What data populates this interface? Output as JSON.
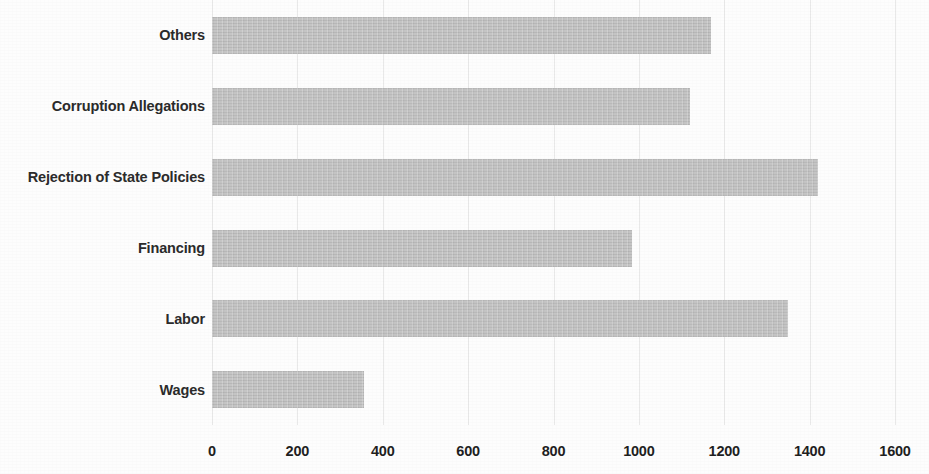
{
  "chart_data": {
    "type": "bar",
    "orientation": "horizontal",
    "title": "",
    "subtitle": "",
    "xlabel": "",
    "ylabel": "",
    "categories": [
      "Wages",
      "Labor",
      "Financing",
      "Rejection of State Policies",
      "Corruption Allegations",
      "Others"
    ],
    "values": [
      355,
      1350,
      985,
      1420,
      1120,
      1170
    ],
    "series": [
      {
        "name": "Count",
        "values": [
          355,
          1350,
          985,
          1420,
          1120,
          1170
        ]
      }
    ],
    "xlim": [
      0,
      1600
    ],
    "ylim": null,
    "x_ticks": [
      0,
      200,
      400,
      600,
      800,
      1000,
      1200,
      1400,
      1600
    ],
    "x_tick_labels": [
      "0",
      "200",
      "400",
      "600",
      "800",
      "1000",
      "1200",
      "1400",
      "1600"
    ],
    "y_tick_labels": [
      "Others",
      "Corruption Allegations",
      "Rejection of State Policies",
      "Financing",
      "Labor",
      "Wages"
    ],
    "grid": true,
    "grid_axis": "x",
    "legend": false,
    "legend_position": "none",
    "annotations": [],
    "data_labels": false,
    "bar_color": "#bfbfbf",
    "grid_color": "#e9e9e9",
    "text_color": "#2b2b2b",
    "background_color": "#fdfdfd",
    "display_order_top_to_bottom": [
      {
        "category": "Others",
        "value": 1170
      },
      {
        "category": "Corruption Allegations",
        "value": 1120
      },
      {
        "category": "Rejection of State Policies",
        "value": 1420
      },
      {
        "category": "Financing",
        "value": 985
      },
      {
        "category": "Labor",
        "value": 1350
      },
      {
        "category": "Wages",
        "value": 355
      }
    ]
  }
}
